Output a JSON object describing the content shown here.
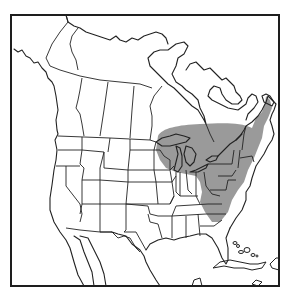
{
  "map": {
    "type": "species-range-map",
    "region": "North America",
    "width": 288,
    "height": 299,
    "frame": {
      "x": 11,
      "y": 15,
      "width": 268,
      "height": 271,
      "color": "#1e1e1e"
    },
    "colors": {
      "background": "#ffffff",
      "outline": "#222222",
      "range_fill": "#9a9a9a"
    },
    "layers": [
      {
        "name": "coastlines",
        "description": "North American coastline outline"
      },
      {
        "name": "political-borders",
        "description": "US state and Canadian province boundaries"
      },
      {
        "name": "range",
        "description": "Shaded distribution area covering the Great Lakes region, southern Ontario/Quebec, New England, the Mid-Atlantic and down the Appalachians"
      },
      {
        "name": "caribbean-islands",
        "description": "Bahamas, Cuba and Hispaniola outlines"
      }
    ],
    "legend": null,
    "labels": []
  }
}
